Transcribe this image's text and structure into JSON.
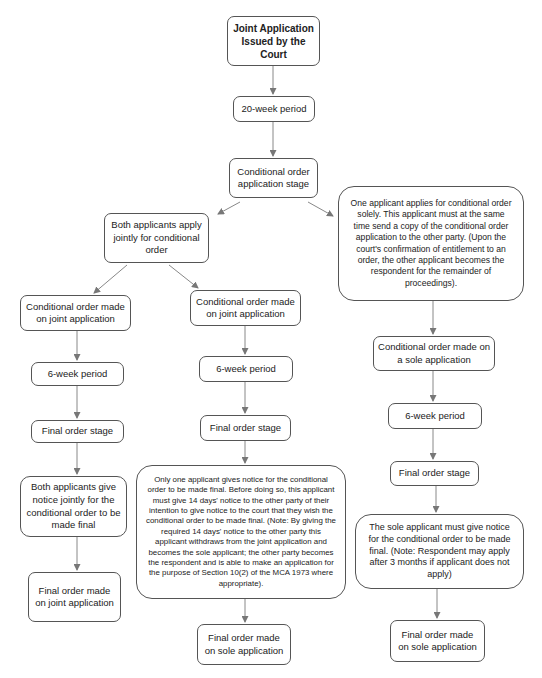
{
  "diagram": {
    "type": "flowchart",
    "nodes": {
      "start": "Joint Application Issued by the Court",
      "twenty_week": "20-week period",
      "co_application_stage": "Conditional order application stage",
      "sole_apply": "One applicant applies for conditional order solely. This applicant must at the same time send a copy of the conditional order application to the other party. (Upon the court's confirmation of entitlement to an order, the other applicant becomes the respondent for the remainder of proceedings).",
      "both_apply": "Both applicants apply jointly for conditional order",
      "left_co_joint": "Conditional order made on joint application",
      "mid_co_joint": "Conditional order made on joint application",
      "left_six_week": "6-week period",
      "mid_six_week": "6-week period",
      "left_final_stage": "Final order stage",
      "mid_final_stage": "Final order stage",
      "left_both_notice": "Both applicants give notice jointly for the conditional order to be made final",
      "mid_one_notice": "Only one applicant gives notice for the conditional order to be made final. Before doing so, this applicant must give 14 days' notice to the other party of their intention to give notice to the court that they wish the conditional order to be made final. (Note: By giving the required 14 days' notice to the other party this applicant withdraws from the joint application and becomes the sole applicant; the other party becomes the respondent and is able to make an application for the purpose of Section 10(2) of the MCA 1973 where appropriate).",
      "left_final_joint": "Final order made on joint application",
      "mid_final_sole": "Final order made on sole application",
      "right_co_sole": "Conditional order made on a sole application",
      "right_six_week": "6-week period",
      "right_final_stage": "Final order stage",
      "right_sole_notice": "The sole applicant must give notice for the conditional order to be made final. (Note: Respondent may apply after 3 months if applicant does not apply)",
      "right_final_sole": "Final order made on sole application"
    },
    "colors": {
      "border": "#555555",
      "arrow": "#777777",
      "background": "#ffffff"
    }
  }
}
